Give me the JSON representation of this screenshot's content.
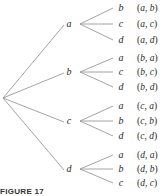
{
  "diagram": {
    "type": "tree",
    "root": "",
    "branches": [
      {
        "label": "a",
        "y": 24,
        "children": [
          {
            "label": "b",
            "pair": "(a, b)",
            "y": 8
          },
          {
            "label": "c",
            "pair": "(a, c)",
            "y": 24
          },
          {
            "label": "d",
            "pair": "(a, d)",
            "y": 40
          }
        ]
      },
      {
        "label": "b",
        "y": 72,
        "children": [
          {
            "label": "a",
            "pair": "(b, a)",
            "y": 58
          },
          {
            "label": "c",
            "pair": "(b, c)",
            "y": 72
          },
          {
            "label": "d",
            "pair": "(b, d)",
            "y": 87
          }
        ]
      },
      {
        "label": "c",
        "y": 121,
        "children": [
          {
            "label": "a",
            "pair": "(c, a)",
            "y": 106
          },
          {
            "label": "b",
            "pair": "(c, b)",
            "y": 121
          },
          {
            "label": "d",
            "pair": "(c, d)",
            "y": 136
          }
        ]
      },
      {
        "label": "d",
        "y": 169,
        "children": [
          {
            "label": "a",
            "pair": "(d, a)",
            "y": 155
          },
          {
            "label": "b",
            "pair": "(d, b)",
            "y": 169
          },
          {
            "label": "c",
            "pair": "(d, c)",
            "y": 183
          }
        ]
      }
    ],
    "caption": "FIGURE 17",
    "line_color": "#9a9a9a"
  }
}
